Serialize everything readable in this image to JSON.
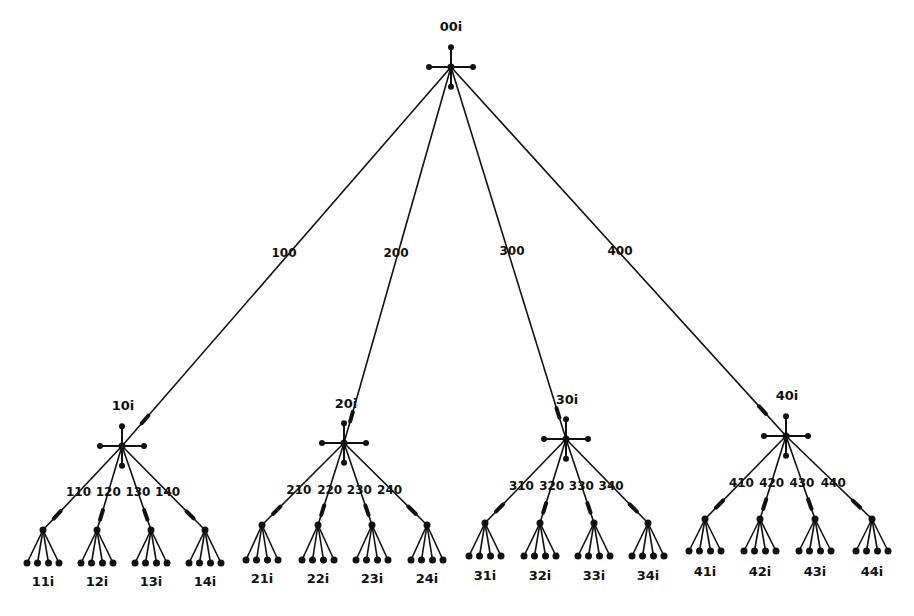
{
  "diagram": {
    "type": "tree",
    "colors": {
      "line": "#111111",
      "background": "#ffffff"
    },
    "root": {
      "id": "00i",
      "label": "00i",
      "x": 451,
      "y": 67
    },
    "groups": [
      {
        "label": "10i",
        "edge_label": "100",
        "x": 122,
        "y": 446,
        "edge_label_pos": [
          284,
          257
        ],
        "label_pos": [
          123,
          410
        ],
        "children": [
          {
            "label": "11i",
            "edge_label": "110",
            "x": 43,
            "y": 530
          },
          {
            "label": "12i",
            "edge_label": "120",
            "x": 97,
            "y": 530
          },
          {
            "label": "13i",
            "edge_label": "130",
            "x": 151,
            "y": 530
          },
          {
            "label": "14i",
            "edge_label": "140",
            "x": 205,
            "y": 530
          }
        ],
        "leaf_y": 563,
        "child_label_y": 586,
        "edge_label_y": 496
      },
      {
        "label": "20i",
        "edge_label": "200",
        "x": 344,
        "y": 443,
        "edge_label_pos": [
          396,
          257
        ],
        "label_pos": [
          346,
          408
        ],
        "children": [
          {
            "label": "21i",
            "edge_label": "210",
            "x": 262,
            "y": 525
          },
          {
            "label": "22i",
            "edge_label": "220",
            "x": 318,
            "y": 525
          },
          {
            "label": "23i",
            "edge_label": "230",
            "x": 372,
            "y": 525
          },
          {
            "label": "24i",
            "edge_label": "240",
            "x": 427,
            "y": 525
          }
        ],
        "leaf_y": 560,
        "child_label_y": 583,
        "edge_label_y": 494
      },
      {
        "label": "30i",
        "edge_label": "300",
        "x": 566,
        "y": 439,
        "edge_label_pos": [
          512,
          255
        ],
        "label_pos": [
          567,
          404
        ],
        "children": [
          {
            "label": "31i",
            "edge_label": "310",
            "x": 485,
            "y": 523
          },
          {
            "label": "32i",
            "edge_label": "320",
            "x": 540,
            "y": 523
          },
          {
            "label": "33i",
            "edge_label": "330",
            "x": 594,
            "y": 523
          },
          {
            "label": "34i",
            "edge_label": "340",
            "x": 648,
            "y": 523
          }
        ],
        "leaf_y": 556,
        "child_label_y": 580,
        "edge_label_y": 490
      },
      {
        "label": "40i",
        "edge_label": "400",
        "x": 786,
        "y": 436,
        "edge_label_pos": [
          620,
          255
        ],
        "label_pos": [
          787,
          400
        ],
        "children": [
          {
            "label": "41i",
            "edge_label": "410",
            "x": 705,
            "y": 519
          },
          {
            "label": "42i",
            "edge_label": "420",
            "x": 760,
            "y": 519
          },
          {
            "label": "43i",
            "edge_label": "430",
            "x": 815,
            "y": 519
          },
          {
            "label": "44i",
            "edge_label": "440",
            "x": 872,
            "y": 519
          }
        ],
        "leaf_y": 551,
        "child_label_y": 576,
        "edge_label_y": 487
      }
    ]
  }
}
